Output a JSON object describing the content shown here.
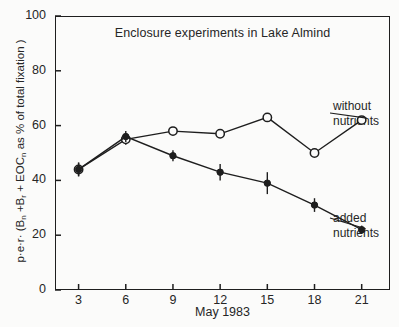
{
  "chart_data": {
    "type": "line",
    "title": "Enclosure experiments in Lake Almind",
    "xlabel": "May 1983",
    "ylabel": "p·e·r· (Bn +Br + EOCn as % of total fixation )",
    "ylabel_parts": {
      "prefix": "p·e·r· (B",
      "sub1": "n",
      "mid1": " +B",
      "sub2": "r",
      "mid2": " + EOC",
      "sub3": "n",
      "suffix": " as % of total fixation )"
    },
    "x": [
      3,
      6,
      9,
      12,
      15,
      18,
      21
    ],
    "xtick_labels": [
      "3",
      "6",
      "9",
      "12",
      "15",
      "18",
      "21"
    ],
    "ytick_labels": [
      "0",
      "20",
      "40",
      "60",
      "80",
      "100"
    ],
    "yticks": [
      0,
      20,
      40,
      60,
      80,
      100
    ],
    "xlim": [
      1.5,
      22.8
    ],
    "ylim": [
      0,
      100
    ],
    "grid": false,
    "legend_position": "inline-right",
    "series": [
      {
        "name": "without nutrients",
        "marker": "open-circle",
        "values": [
          44,
          55,
          58,
          57,
          63,
          50,
          62
        ],
        "errors": [
          2.5,
          2.0,
          0,
          0,
          0,
          0,
          0
        ]
      },
      {
        "name": "added nutrients",
        "marker": "filled-circle",
        "values": [
          44,
          56,
          49,
          43,
          39,
          31,
          22
        ],
        "errors": [
          2.5,
          2.0,
          2.0,
          3.0,
          4.0,
          2.5,
          1.5
        ]
      }
    ],
    "annotations": [
      {
        "id": "without",
        "line1": "without",
        "line2": "nutrients"
      },
      {
        "id": "added",
        "line1": "added",
        "line2": "nutrients"
      }
    ],
    "colors": {
      "ink": "#1e1e1e",
      "paper": "#fbfbfa"
    }
  }
}
